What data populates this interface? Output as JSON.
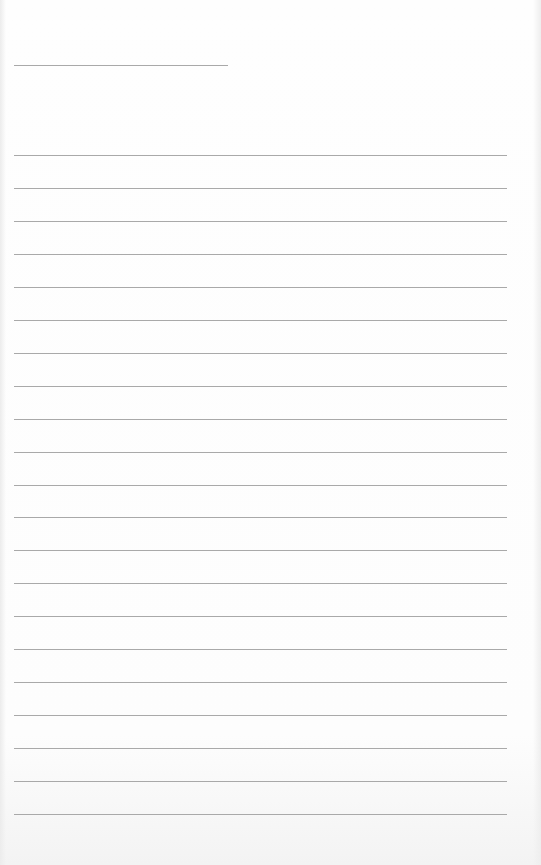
{
  "page": {
    "type": "lined-writing-sheet",
    "background_color": "#fdfdfd",
    "line_color": "#a9a9a9"
  },
  "header_line": {
    "x": 14,
    "y": 65,
    "width": 214
  },
  "writing_lines": {
    "x": 14,
    "width": 493,
    "y_positions": [
      155,
      188,
      221,
      254,
      287,
      320,
      353,
      386,
      419,
      452,
      485,
      517,
      550,
      583,
      616,
      649,
      682,
      715,
      748,
      781,
      814
    ]
  }
}
